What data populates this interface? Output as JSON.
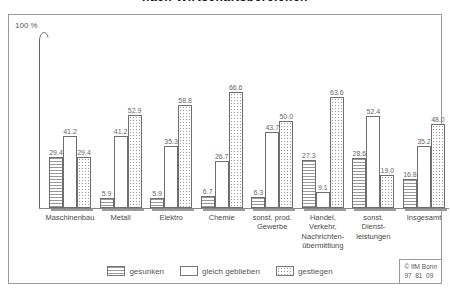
{
  "title_cropped": "nach Wirtschaftsbereichen",
  "y_axis": {
    "top_label": "100 %"
  },
  "chart_data": {
    "type": "bar",
    "ylabel": "100 %",
    "ylim": [
      0,
      100
    ],
    "grid": false,
    "legend_position": "bottom",
    "categories": [
      "Maschinenbau",
      "Metall",
      "Elektro",
      "Chemie",
      "sonst. prod.\nGewerbe",
      "Handel,\nVerkehr,\nNachrichten-\nübermittlung",
      "sonst.\nDienst-\nleistungen",
      "Insgesamt"
    ],
    "series": [
      {
        "name": "gesunken",
        "pattern": "horizontal-lines",
        "values": [
          "29.4",
          "5.9",
          "5.9",
          "6.7",
          "6.3",
          "27.3",
          "28.6",
          "16.8"
        ]
      },
      {
        "name": "gleich geblieben",
        "pattern": "plain",
        "values": [
          "41.2",
          "41.2",
          "35.3",
          "26.7",
          "43.7",
          "9.1",
          "52.4",
          "35.2"
        ]
      },
      {
        "name": "gestiegen",
        "pattern": "dots",
        "values": [
          "29.4",
          "52.9",
          "58.8",
          "66.6",
          "50.0",
          "63.6",
          "19.0",
          "48.0"
        ]
      }
    ]
  },
  "stamp": {
    "line1": "© IfM Bonn",
    "line2": "97  81  09"
  },
  "colors": {
    "frame_border": "#9a9a9a",
    "bar_border": "#6e6e6e",
    "pattern_ink": "#999999",
    "text": "#4a4a4a",
    "title_text": "#111111"
  }
}
